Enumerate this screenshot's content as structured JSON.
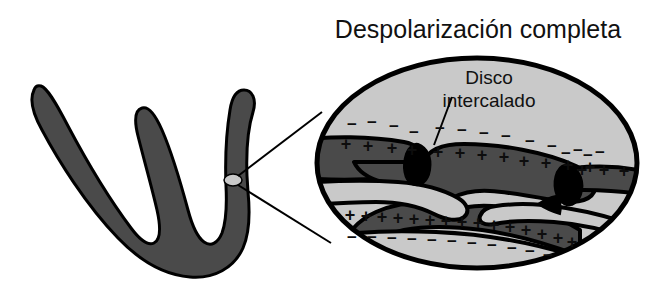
{
  "figure": {
    "type": "biology-diagram",
    "background_color": "#ffffff",
    "title": "Despolarización completa",
    "inset_label": "Disco intercalado"
  },
  "colors": {
    "outline": "#000000",
    "cell_dark_gray": "#4a4a4a",
    "interstitium_light_gray": "#c9c9c9",
    "disc_black": "#000000",
    "marker_ellipse": "#c9c9c9",
    "text": "#111111",
    "white": "#ffffff"
  },
  "title_block": {
    "text": "Despolarización completa",
    "x": 478,
    "y": 38,
    "font_size": 25,
    "anchor": "middle"
  },
  "inset_label_block": {
    "lines": [
      "Disco",
      "intercalado"
    ],
    "x": 489,
    "y_first_line": 84,
    "line_height": 23,
    "font_size": 19,
    "anchor": "middle"
  },
  "cell_fiber": {
    "name": "branching-cardiac-muscle-fiber",
    "fill": "#4a4a4a",
    "stroke": "#000000",
    "stroke_width": 3,
    "branch_count": 3,
    "marker": {
      "name": "zoom-region-marker",
      "cx": 233,
      "cy": 180,
      "rx": 9,
      "ry": 6,
      "fill": "#c9c9c9"
    }
  },
  "leader_lines": [
    {
      "name": "leader-line-upper",
      "x1": 238,
      "y1": 176,
      "x2": 322,
      "y2": 112
    },
    {
      "name": "leader-line-lower",
      "x1": 238,
      "y1": 185,
      "x2": 331,
      "y2": 243
    }
  ],
  "inset_oval": {
    "name": "magnified-inset-oval",
    "cx": 477,
    "cy": 163,
    "rx": 163,
    "ry": 108,
    "fill": "#c9c9c9",
    "stroke": "#000000",
    "stroke_width": 5
  },
  "pointer_line": {
    "name": "disco-intercalado-pointer",
    "x1": 452,
    "y1": 97,
    "x2": 434,
    "y2": 145
  },
  "charge_groups": [
    {
      "name": "negative-charges-upper-left",
      "sign": "−",
      "font_size": 17,
      "positions": [
        [
          352,
          130
        ],
        [
          372,
          128
        ],
        [
          394,
          132
        ],
        [
          414,
          138
        ]
      ]
    },
    {
      "name": "negative-charges-upper-right",
      "sign": "−",
      "font_size": 17,
      "positions": [
        [
          440,
          134
        ],
        [
          462,
          136
        ],
        [
          484,
          139
        ],
        [
          506,
          142
        ],
        [
          530,
          147
        ],
        [
          552,
          152
        ],
        [
          578,
          156
        ],
        [
          600,
          158
        ],
        [
          566,
          159
        ],
        [
          588,
          161
        ]
      ]
    },
    {
      "name": "positive-charges-upper-left-cell",
      "sign": "+",
      "font_size": 18,
      "positions": [
        [
          346,
          150
        ],
        [
          368,
          152
        ],
        [
          392,
          154
        ],
        [
          412,
          156
        ]
      ]
    },
    {
      "name": "positive-charges-central-cell",
      "sign": "+",
      "font_size": 18,
      "positions": [
        [
          438,
          158
        ],
        [
          460,
          159
        ],
        [
          482,
          161
        ],
        [
          504,
          163
        ],
        [
          524,
          167
        ],
        [
          546,
          169
        ],
        [
          568,
          171
        ],
        [
          590,
          173
        ]
      ]
    },
    {
      "name": "positive-charges-right-cell",
      "sign": "+",
      "font_size": 18,
      "positions": [
        [
          582,
          176
        ],
        [
          604,
          176
        ],
        [
          624,
          177
        ]
      ]
    },
    {
      "name": "positive-charges-lower-cell",
      "sign": "+",
      "font_size": 18,
      "positions": [
        [
          350,
          221
        ],
        [
          366,
          222
        ],
        [
          382,
          223
        ],
        [
          398,
          224
        ],
        [
          414,
          225
        ],
        [
          430,
          226
        ],
        [
          446,
          227
        ],
        [
          462,
          228
        ],
        [
          478,
          229
        ],
        [
          494,
          231
        ],
        [
          510,
          233
        ],
        [
          526,
          236
        ],
        [
          542,
          240
        ],
        [
          558,
          244
        ],
        [
          572,
          248
        ]
      ]
    },
    {
      "name": "negative-charges-lower-outer",
      "sign": "−",
      "font_size": 17,
      "positions": [
        [
          352,
          243
        ],
        [
          372,
          243
        ],
        [
          392,
          244
        ],
        [
          412,
          245
        ],
        [
          432,
          246
        ],
        [
          452,
          247
        ],
        [
          472,
          249
        ],
        [
          492,
          251
        ],
        [
          512,
          254
        ],
        [
          530,
          257
        ],
        [
          548,
          261
        ]
      ]
    }
  ],
  "annotations": {
    "description": "Cardiac muscle fiber with intercalated discs; inset shows complete depolarization with positive charges inside cells and negative charges in extracellular space."
  }
}
